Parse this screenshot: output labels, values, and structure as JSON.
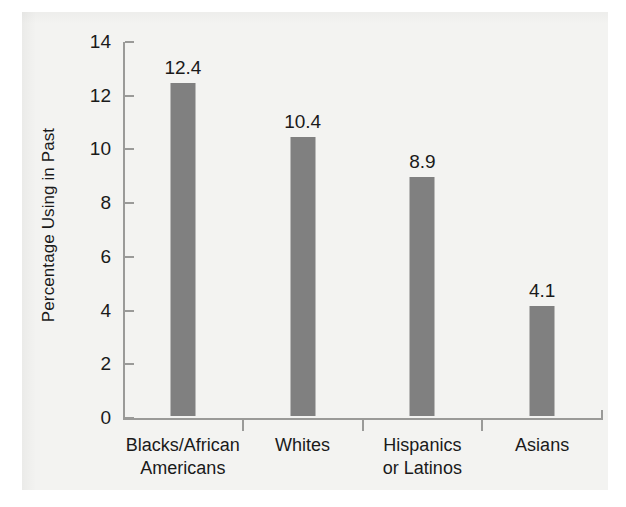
{
  "chart_data": {
    "type": "bar",
    "title": "",
    "xlabel": "",
    "ylabel": "Percentage Using in Past",
    "categories": [
      "Blacks/African Americans",
      "Whites",
      "Hispanics or Latinos",
      "Asians"
    ],
    "category_lines": [
      [
        "Blacks/African",
        "Americans"
      ],
      [
        "Whites",
        ""
      ],
      [
        "Hispanics",
        "or Latinos"
      ],
      [
        "Asians",
        ""
      ]
    ],
    "values": [
      12.4,
      10.4,
      8.9,
      4.1
    ],
    "value_labels": [
      "12.4",
      "10.4",
      "8.9",
      "4.1"
    ],
    "ylim": [
      0,
      14
    ],
    "ytick_values": [
      14,
      12,
      10,
      8,
      6,
      4,
      2,
      0
    ],
    "ytick_labels": [
      "14",
      "12",
      "10",
      "8",
      "6",
      "4",
      "2",
      "0"
    ],
    "grid": false,
    "legend": "none",
    "bar_color": "#808080",
    "axis_color": "#9a9a98",
    "text_color": "#1a1a1a",
    "background_color": "#f3f3f1"
  }
}
